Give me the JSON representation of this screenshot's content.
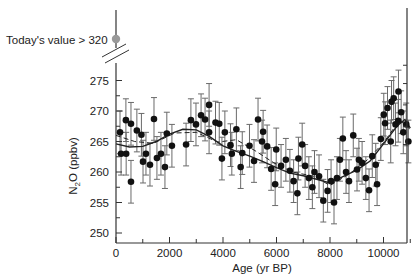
{
  "chart_data": {
    "type": "scatter",
    "title": "",
    "xlabel": "Age (yr BP)",
    "ylabel": "N2O (ppbv)",
    "ylabel_main": "N",
    "ylabel_sub": "2",
    "ylabel_rest": "O (ppbv)",
    "xlim": [
      0,
      11000
    ],
    "ylim": [
      249,
      277
    ],
    "x_ticks": [
      0,
      2000,
      4000,
      6000,
      8000,
      10000
    ],
    "x_minor_step": 1000,
    "y_ticks": [
      250,
      255,
      260,
      265,
      270,
      275
    ],
    "y_minor_step": 2.5,
    "grid": false,
    "annotation": {
      "text": "Today's value > 320",
      "marker_color": "#999999",
      "axis_break": true
    },
    "errorbar_half_width_ppbv": 3.5,
    "points": [
      [
        150,
        266.5
      ],
      [
        370,
        268.5
      ],
      [
        190,
        263.0
      ],
      [
        560,
        267.9
      ],
      [
        780,
        266.8
      ],
      [
        380,
        263.0
      ],
      [
        560,
        258.4
      ],
      [
        950,
        266.1
      ],
      [
        1120,
        263.0
      ],
      [
        1010,
        261.7
      ],
      [
        1270,
        261.2
      ],
      [
        1420,
        268.7
      ],
      [
        1530,
        262.3
      ],
      [
        1680,
        263.0
      ],
      [
        1830,
        260.8
      ],
      [
        1900,
        266.3
      ],
      [
        2090,
        264.3
      ],
      [
        2620,
        264.5
      ],
      [
        2800,
        268.5
      ],
      [
        2990,
        267.8
      ],
      [
        3180,
        269.3
      ],
      [
        3330,
        268.6
      ],
      [
        3480,
        271.0
      ],
      [
        3480,
        266.5
      ],
      [
        3720,
        268.1
      ],
      [
        3860,
        267.9
      ],
      [
        3960,
        262.2
      ],
      [
        4070,
        266.5
      ],
      [
        4280,
        264.4
      ],
      [
        4330,
        263.0
      ],
      [
        4500,
        267.0
      ],
      [
        4660,
        260.8
      ],
      [
        4720,
        263.1
      ],
      [
        4990,
        264.3
      ],
      [
        5160,
        261.8
      ],
      [
        5310,
        268.6
      ],
      [
        5460,
        265.0
      ],
      [
        5500,
        266.6
      ],
      [
        5650,
        264.2
      ],
      [
        5800,
        260.5
      ],
      [
        5950,
        258.0
      ],
      [
        5990,
        263.7
      ],
      [
        6170,
        261.0
      ],
      [
        6350,
        262.0
      ],
      [
        6500,
        260.2
      ],
      [
        6640,
        258.5
      ],
      [
        6780,
        256.5
      ],
      [
        6820,
        262.2
      ],
      [
        6960,
        264.5
      ],
      [
        7070,
        261.0
      ],
      [
        7210,
        259.0
      ],
      [
        7340,
        257.5
      ],
      [
        7420,
        260.0
      ],
      [
        7590,
        259.3
      ],
      [
        7750,
        255.3
      ],
      [
        7910,
        256.9
      ],
      [
        8040,
        258.5
      ],
      [
        8150,
        255.0
      ],
      [
        8260,
        259.0
      ],
      [
        8370,
        262.0
      ],
      [
        8480,
        265.5
      ],
      [
        8600,
        260.0
      ],
      [
        8710,
        258.5
      ],
      [
        8870,
        266.0
      ],
      [
        9010,
        260.4
      ],
      [
        9080,
        262.0
      ],
      [
        9200,
        261.5
      ],
      [
        9340,
        259.0
      ],
      [
        9460,
        257.0
      ],
      [
        9580,
        262.6
      ],
      [
        9710,
        261.2
      ],
      [
        9760,
        258.0
      ],
      [
        9900,
        265.4
      ],
      [
        10010,
        269.4
      ],
      [
        10060,
        268.0
      ],
      [
        10150,
        270.5
      ],
      [
        10270,
        265.0
      ],
      [
        10380,
        272.1
      ],
      [
        10450,
        267.8
      ],
      [
        10560,
        273.2
      ],
      [
        10660,
        269.8
      ],
      [
        10740,
        266.5
      ],
      [
        10850,
        267.8
      ],
      [
        10930,
        265.0
      ],
      [
        10300,
        271.5
      ],
      [
        10550,
        268.4
      ]
    ],
    "trend_solid": [
      [
        0,
        264.6
      ],
      [
        500,
        264.1
      ],
      [
        1000,
        264.2
      ],
      [
        1500,
        265.0
      ],
      [
        2000,
        266.2
      ],
      [
        2500,
        267.0
      ],
      [
        3000,
        266.9
      ],
      [
        3500,
        265.8
      ],
      [
        4000,
        264.3
      ],
      [
        4500,
        263.4
      ],
      [
        5000,
        262.6
      ],
      [
        5500,
        261.7
      ],
      [
        6000,
        260.7
      ],
      [
        6500,
        259.8
      ],
      [
        7000,
        259.4
      ],
      [
        7500,
        258.8
      ],
      [
        8000,
        258.2
      ],
      [
        8500,
        259.3
      ],
      [
        9000,
        260.3
      ],
      [
        9500,
        261.8
      ],
      [
        10000,
        264.6
      ],
      [
        10500,
        267.5
      ],
      [
        10800,
        268.6
      ],
      [
        11000,
        267.2
      ]
    ],
    "trend_dashed": [
      [
        0,
        266.0
      ],
      [
        700,
        265.0
      ],
      [
        1400,
        264.7
      ],
      [
        2200,
        266.4
      ],
      [
        3000,
        266.5
      ],
      [
        3800,
        264.9
      ],
      [
        4500,
        265.3
      ],
      [
        5200,
        263.5
      ],
      [
        5900,
        261.5
      ],
      [
        6600,
        260.0
      ],
      [
        7400,
        259.3
      ],
      [
        8000,
        257.8
      ],
      [
        8700,
        259.6
      ],
      [
        9400,
        262.0
      ],
      [
        10000,
        264.8
      ],
      [
        10600,
        268.5
      ],
      [
        11000,
        267.0
      ]
    ]
  },
  "plot_area": {
    "left": 116,
    "right": 407,
    "top": 10,
    "bottom": 243,
    "y_axis_px_per_unit": 6.1,
    "x_px_per_year": 0.02675
  },
  "colors": {
    "axis": "#333333",
    "point": "#111111",
    "errorbar": "#6a6a6a",
    "today_marker": "#999999",
    "trend": "#222222"
  }
}
